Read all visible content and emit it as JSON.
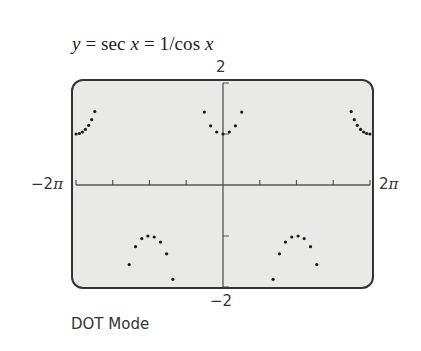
{
  "title": {
    "prefix": "y",
    "eq1": " = sec ",
    "var1": "x",
    "eq2": " = 1/cos ",
    "var2": "x"
  },
  "labels": {
    "y_max": "2",
    "y_min": "−2",
    "x_min": "−2",
    "x_min_pi": "π",
    "x_max": "2",
    "x_max_pi": "π"
  },
  "footer": "DOT Mode",
  "colors": {
    "screen_bg": "#e9e9e7",
    "border": "#333333",
    "axis": "#555555",
    "dot": "#1a1a1a"
  },
  "chart_data": {
    "type": "scatter",
    "title": "y = sec x = 1/cos x",
    "function": "sec(x)",
    "mode": "DOT",
    "xlabel": "",
    "ylabel": "",
    "xlim": [
      -6.2832,
      6.2832
    ],
    "ylim": [
      -2,
      2
    ],
    "x_tick_labels": [
      "−2π",
      "2π"
    ],
    "y_tick_labels": [
      "−2",
      "2"
    ],
    "x_scale": 1.5708,
    "y_scale": 1,
    "x_ticks": [
      -6.2832,
      -4.7124,
      -3.1416,
      -1.5708,
      0,
      1.5708,
      3.1416,
      4.7124,
      6.2832
    ],
    "y_ticks": [
      -2,
      -1,
      0,
      1,
      2
    ],
    "grid": false,
    "legend": null,
    "sample_points": 94,
    "series": [
      {
        "name": "sec x (x ≈ −2π to −3π/2)",
        "x": [
          -6.28,
          -6.14,
          -6.01,
          -5.88,
          -5.74,
          -5.61,
          -5.48,
          -5.21
        ],
        "y": [
          1.0,
          1.01,
          1.04,
          1.09,
          1.17,
          1.28,
          1.44,
          2.07
        ]
      },
      {
        "name": "sec x (x ≈ −3π/2 to −π/2)",
        "x": [
          -4.27,
          -4.01,
          -3.74,
          -3.47,
          -3.21,
          -2.94,
          -2.67,
          -2.41,
          -2.14,
          -1.87
        ],
        "y": [
          -2.34,
          -1.56,
          -1.21,
          -1.05,
          -1.0,
          -1.02,
          -1.12,
          -1.35,
          -1.85,
          -3.36
        ]
      },
      {
        "name": "sec x (x ≈ −π/2 to π/2)",
        "x": [
          -1.07,
          -0.8,
          -0.53,
          -0.27,
          0.0,
          0.27,
          0.53,
          0.8,
          1.07
        ],
        "y": [
          2.08,
          1.43,
          1.16,
          1.04,
          1.0,
          1.04,
          1.16,
          1.43,
          2.08
        ]
      },
      {
        "name": "sec x (x ≈ π/2 to 3π/2)",
        "x": [
          1.87,
          2.14,
          2.41,
          2.67,
          2.94,
          3.21,
          3.47,
          3.74,
          4.01,
          4.27
        ],
        "y": [
          -3.36,
          -1.85,
          -1.35,
          -1.12,
          -1.02,
          -1.0,
          -1.05,
          -1.21,
          -1.56,
          -2.34
        ]
      },
      {
        "name": "sec x (x ≈ 3π/2 to 2π)",
        "x": [
          5.21,
          5.48,
          5.61,
          5.74,
          5.88,
          6.01,
          6.14,
          6.28
        ],
        "y": [
          2.07,
          1.44,
          1.28,
          1.17,
          1.09,
          1.04,
          1.01,
          1.0
        ]
      }
    ]
  }
}
